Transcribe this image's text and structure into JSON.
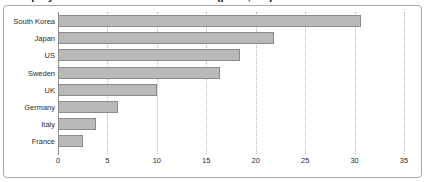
{
  "figure": {
    "title_fragment": "Employment in the automotive sector (per 1,000)",
    "frame_color": "#a8a8a8",
    "background": "#ffffff"
  },
  "chart_data": {
    "type": "bar",
    "orientation": "horizontal",
    "title": "",
    "xlabel": "",
    "ylabel": "",
    "xlim": [
      0,
      35
    ],
    "grid": true,
    "legend": false,
    "bar_color": "#b9b9b9",
    "bar_edge_color": "#8b8b8b",
    "xticks": [
      "0",
      "5",
      "10",
      "15",
      "20",
      "25",
      "30",
      "35"
    ],
    "xtick_values": [
      0,
      5,
      10,
      15,
      20,
      25,
      30,
      35
    ],
    "categories": [
      "South Korea",
      "Japan",
      "US",
      "Sweden",
      "UK",
      "Germany",
      "Italy",
      "France"
    ],
    "values": [
      30.6,
      21.8,
      18.4,
      16.4,
      10.0,
      6.1,
      3.8,
      2.5
    ]
  }
}
